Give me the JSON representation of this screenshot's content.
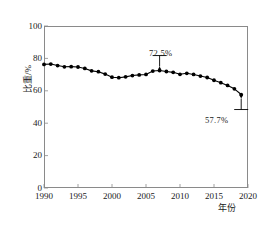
{
  "chart_data": {
    "type": "line",
    "title": "",
    "xlabel": "年份",
    "ylabel": "比重/%",
    "xlim": [
      1990,
      2020
    ],
    "ylim": [
      0,
      100
    ],
    "grid": false,
    "legend": "none",
    "x": [
      1990,
      1991,
      1992,
      1993,
      1994,
      1995,
      1996,
      1997,
      1998,
      1999,
      2000,
      2001,
      2002,
      2003,
      2004,
      2005,
      2006,
      2007,
      2008,
      2009,
      2010,
      2011,
      2012,
      2013,
      2014,
      2015,
      2016,
      2017,
      2018,
      2019
    ],
    "values": [
      76.3,
      76.5,
      75.6,
      74.8,
      74.9,
      74.7,
      73.8,
      72.3,
      71.8,
      70.3,
      68.4,
      68.1,
      68.6,
      69.4,
      69.8,
      70.1,
      72.2,
      72.5,
      71.9,
      71.4,
      70.2,
      70.8,
      70.1,
      69.1,
      68.2,
      66.5,
      65.0,
      63.3,
      61.2,
      57.7
    ],
    "xticks": [
      1990,
      1995,
      2000,
      2005,
      2010,
      2015,
      2020
    ],
    "xtick_labels": [
      "1990",
      "1995",
      "2000",
      "2005",
      "2010",
      "2015",
      "2020"
    ],
    "yticks": [
      0,
      20,
      40,
      60,
      80,
      100
    ],
    "ytick_labels": [
      "0",
      "20",
      "40",
      "60",
      "80",
      "100"
    ],
    "annotations": [
      {
        "label": "72.5%",
        "x": 2007,
        "y": 72.5,
        "position": "above"
      },
      {
        "label": "57.7%",
        "x": 2019,
        "y": 57.7,
        "position": "below"
      }
    ],
    "series_color": "#000000",
    "marker": "circle",
    "axis_color": "#8a8a8a"
  }
}
